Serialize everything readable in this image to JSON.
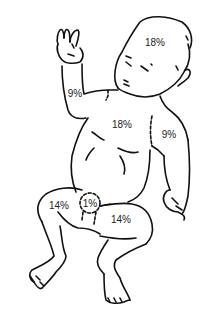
{
  "diagram": {
    "line_color": "#111111",
    "text_color": "#222222",
    "regions": [
      {
        "id": "head",
        "label": "18%",
        "x": 155,
        "y": 43
      },
      {
        "id": "left-arm",
        "label": "9%",
        "x": 75,
        "y": 94
      },
      {
        "id": "trunk",
        "label": "18%",
        "x": 122,
        "y": 125
      },
      {
        "id": "right-arm",
        "label": "9%",
        "x": 169,
        "y": 135
      },
      {
        "id": "left-leg",
        "label": "14%",
        "x": 59,
        "y": 206
      },
      {
        "id": "genitalia",
        "label": "1%",
        "x": 90,
        "y": 204
      },
      {
        "id": "right-leg",
        "label": "14%",
        "x": 121,
        "y": 220
      }
    ]
  }
}
